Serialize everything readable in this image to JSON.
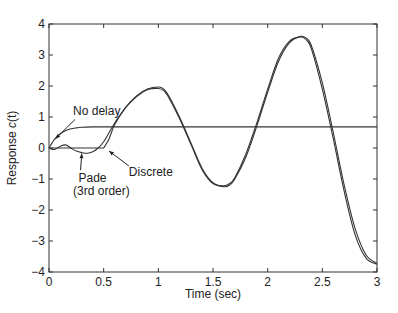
{
  "chart_data": {
    "type": "line",
    "title": "",
    "xlabel": "Time (sec)",
    "ylabel": "Response c(t)",
    "ylabel_parts": {
      "prefix": "Response ",
      "italic": "c",
      "suffix": "(t)"
    },
    "xlim": [
      0,
      3
    ],
    "ylim": [
      -4,
      4
    ],
    "xticks": [
      0,
      0.5,
      1,
      1.5,
      2,
      2.5,
      3
    ],
    "xtick_labels": [
      "0",
      "0.5",
      "1",
      "1.5",
      "2",
      "2.5",
      "3"
    ],
    "yticks": [
      -4,
      -3,
      -2,
      -1,
      0,
      1,
      2,
      3,
      4
    ],
    "ytick_labels": [
      "−4",
      "−3",
      "−2",
      "−1",
      "0",
      "1",
      "2",
      "3",
      "4"
    ],
    "grid": false,
    "legend": null,
    "line_color": "#333333",
    "series": [
      {
        "name": "No delay",
        "x": [
          0,
          0.05,
          0.1,
          0.15,
          0.2,
          0.25,
          0.3,
          0.4,
          0.5,
          0.7,
          1.0,
          1.5,
          2.0,
          2.5,
          3.0
        ],
        "y": [
          0,
          0.28,
          0.45,
          0.56,
          0.62,
          0.65,
          0.67,
          0.68,
          0.68,
          0.68,
          0.68,
          0.68,
          0.68,
          0.68,
          0.68
        ]
      },
      {
        "name": "Pade (3rd order)",
        "x": [
          0,
          0.05,
          0.1,
          0.15,
          0.2,
          0.25,
          0.3,
          0.35,
          0.4,
          0.45,
          0.5,
          0.55,
          0.6,
          0.7,
          0.8,
          0.9,
          1.0,
          1.05,
          1.1,
          1.2,
          1.3,
          1.4,
          1.5,
          1.6,
          1.65,
          1.7,
          1.8,
          1.9,
          2.0,
          2.1,
          2.2,
          2.3,
          2.35,
          2.4,
          2.5,
          2.6,
          2.7,
          2.8,
          2.9,
          3.0
        ],
        "y": [
          0,
          -0.05,
          0.05,
          0.1,
          0.0,
          -0.1,
          -0.15,
          -0.17,
          -0.12,
          0.0,
          0.2,
          0.5,
          0.8,
          1.3,
          1.65,
          1.88,
          1.92,
          1.85,
          1.6,
          0.9,
          0.1,
          -0.7,
          -1.15,
          -1.22,
          -1.15,
          -0.95,
          -0.2,
          0.8,
          1.9,
          2.9,
          3.45,
          3.58,
          3.5,
          3.2,
          1.9,
          0.3,
          -1.4,
          -2.8,
          -3.55,
          -3.75
        ]
      },
      {
        "name": "Discrete",
        "x": [
          0,
          0.1,
          0.2,
          0.3,
          0.4,
          0.5,
          0.55,
          0.6,
          0.7,
          0.8,
          0.9,
          1.0,
          1.05,
          1.1,
          1.2,
          1.3,
          1.4,
          1.5,
          1.6,
          1.65,
          1.7,
          1.8,
          1.9,
          2.0,
          2.1,
          2.2,
          2.3,
          2.35,
          2.4,
          2.5,
          2.6,
          2.7,
          2.8,
          2.9,
          3.0
        ],
        "y": [
          0,
          0,
          0,
          0,
          0,
          0,
          0.3,
          0.75,
          1.3,
          1.68,
          1.9,
          1.97,
          1.9,
          1.65,
          0.95,
          0.15,
          -0.65,
          -1.12,
          -1.25,
          -1.2,
          -1.0,
          -0.3,
          0.7,
          1.8,
          2.8,
          3.4,
          3.6,
          3.55,
          3.3,
          2.1,
          0.5,
          -1.2,
          -2.6,
          -3.45,
          -3.72
        ]
      }
    ],
    "annotations": [
      {
        "text": "No delay",
        "x": 0.22,
        "y": 1.05,
        "arrow_to": [
          0.06,
          0.3
        ]
      },
      {
        "text": "Pade",
        "x": 0.27,
        "y": -1.1,
        "arrow_to": [
          0.3,
          -0.18
        ]
      },
      {
        "text": "(3rd order)",
        "x": 0.22,
        "y": -1.5
      },
      {
        "text": "Discrete",
        "x": 0.73,
        "y": -0.9,
        "arrow_to": [
          0.55,
          -0.1
        ]
      }
    ]
  }
}
